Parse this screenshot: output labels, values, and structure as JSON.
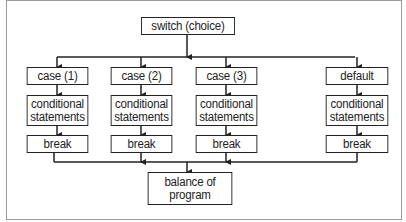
{
  "diagram": {
    "type": "flowchart",
    "title_node": "switch (choice)",
    "branches": [
      {
        "case": "case (1)",
        "body": "conditional\nstatements",
        "exit": "break"
      },
      {
        "case": "case (2)",
        "body": "conditional\nstatements",
        "exit": "break"
      },
      {
        "case": "case (3)",
        "body": "conditional\nstatements",
        "exit": "break"
      },
      {
        "case": "default",
        "body": "conditional\nstatements",
        "exit": "break"
      }
    ],
    "end_node": "balance of\nprogram",
    "colors": {
      "line": "#222222",
      "frame": "#9a9a9a",
      "background": "#ffffff"
    }
  }
}
